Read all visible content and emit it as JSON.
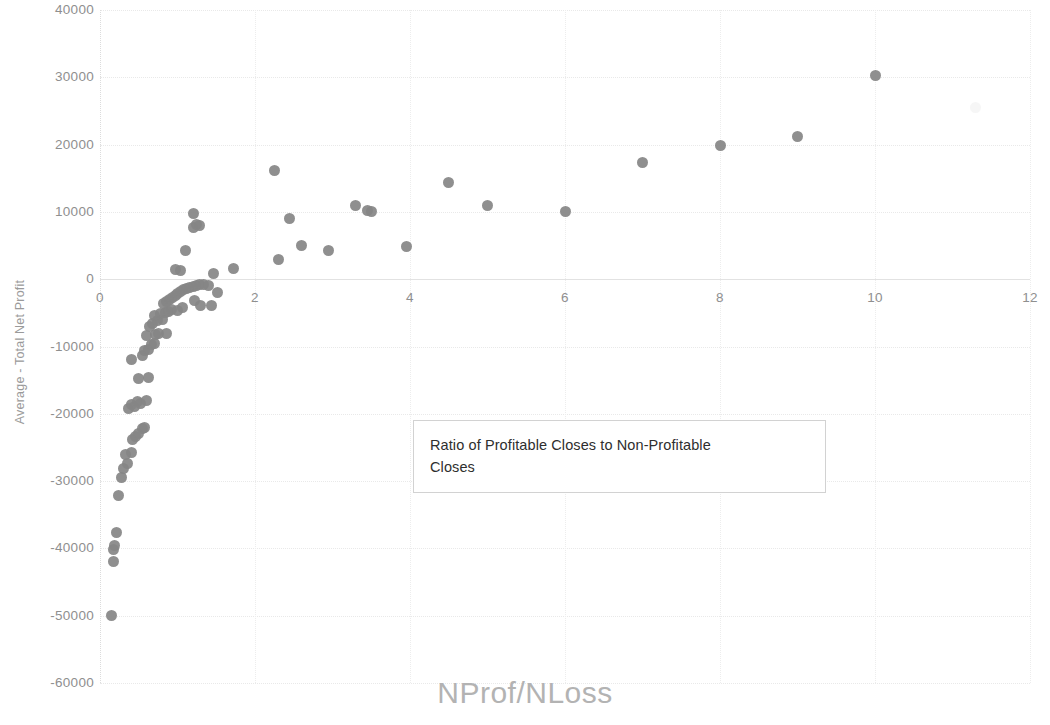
{
  "chart_data": {
    "type": "scatter",
    "title": "",
    "xlabel": "NProf/NLoss",
    "ylabel": "Average - Total Net Profit",
    "xlim": [
      0,
      12
    ],
    "ylim": [
      -60000,
      40000
    ],
    "xticks": [
      0,
      2,
      4,
      6,
      8,
      10,
      12
    ],
    "yticks": [
      40000,
      30000,
      20000,
      10000,
      0,
      -10000,
      -20000,
      -30000,
      -40000,
      -50000,
      -60000
    ],
    "xtick_labels": [
      "0",
      "2",
      "4",
      "6",
      "8",
      "10",
      "12"
    ],
    "ytick_labels": [
      "40000",
      "30000",
      "20000",
      "10000",
      "0",
      "-10000",
      "-20000",
      "-30000",
      "-40000",
      "-50000",
      "-60000"
    ],
    "grid": true,
    "legend": false,
    "marker_color": "#868686",
    "marker_shape": "circle",
    "annotation": {
      "line1": "Ratio of Profitable Closes to Non-Profitable",
      "line2": "Closes"
    },
    "series": [
      {
        "name": "Average - Total Net Profit",
        "points": [
          [
            0.15,
            -50000
          ],
          [
            0.17,
            -42000
          ],
          [
            0.18,
            -40200
          ],
          [
            0.19,
            -39600
          ],
          [
            0.21,
            -37600
          ],
          [
            0.24,
            -32200
          ],
          [
            0.28,
            -29400
          ],
          [
            0.3,
            -28200
          ],
          [
            0.35,
            -27400
          ],
          [
            0.33,
            -26000
          ],
          [
            0.4,
            -25700
          ],
          [
            0.42,
            -23800
          ],
          [
            0.46,
            -23300
          ],
          [
            0.5,
            -23000
          ],
          [
            0.55,
            -22200
          ],
          [
            0.58,
            -22000
          ],
          [
            0.37,
            -19200
          ],
          [
            0.41,
            -18600
          ],
          [
            0.45,
            -18900
          ],
          [
            0.48,
            -18200
          ],
          [
            0.52,
            -18400
          ],
          [
            0.6,
            -18000
          ],
          [
            0.5,
            -14800
          ],
          [
            0.62,
            -14600
          ],
          [
            0.4,
            -12000
          ],
          [
            0.55,
            -11300
          ],
          [
            0.58,
            -10600
          ],
          [
            0.63,
            -10400
          ],
          [
            0.66,
            -9700
          ],
          [
            0.7,
            -9500
          ],
          [
            0.6,
            -8400
          ],
          [
            0.72,
            -8200
          ],
          [
            0.76,
            -8000
          ],
          [
            0.86,
            -8100
          ],
          [
            0.64,
            -7000
          ],
          [
            0.68,
            -6600
          ],
          [
            0.74,
            -6200
          ],
          [
            0.8,
            -6000
          ],
          [
            0.7,
            -5400
          ],
          [
            0.78,
            -5100
          ],
          [
            0.84,
            -5000
          ],
          [
            0.88,
            -4800
          ],
          [
            0.92,
            -4500
          ],
          [
            1.0,
            -4600
          ],
          [
            1.06,
            -4200
          ],
          [
            0.82,
            -3600
          ],
          [
            0.86,
            -3300
          ],
          [
            0.9,
            -3000
          ],
          [
            0.94,
            -2700
          ],
          [
            0.97,
            -2400
          ],
          [
            1.0,
            -2100
          ],
          [
            1.04,
            -1900
          ],
          [
            1.08,
            -1600
          ],
          [
            1.12,
            -1400
          ],
          [
            1.16,
            -1200
          ],
          [
            1.2,
            -1050
          ],
          [
            1.24,
            -900
          ],
          [
            1.28,
            -800
          ],
          [
            1.34,
            -750
          ],
          [
            1.4,
            -1000
          ],
          [
            1.22,
            -3100
          ],
          [
            1.3,
            -3900
          ],
          [
            1.44,
            -3900
          ],
          [
            1.52,
            -2000
          ],
          [
            0.98,
            1400
          ],
          [
            1.04,
            1300
          ],
          [
            1.46,
            800
          ],
          [
            1.1,
            4300
          ],
          [
            1.2,
            7700
          ],
          [
            1.24,
            8100
          ],
          [
            1.28,
            8000
          ],
          [
            1.2,
            9700
          ],
          [
            1.72,
            1600
          ],
          [
            2.25,
            16100
          ],
          [
            2.3,
            2900
          ],
          [
            2.45,
            9000
          ],
          [
            2.6,
            5000
          ],
          [
            2.95,
            4200
          ],
          [
            3.3,
            10900
          ],
          [
            3.45,
            10200
          ],
          [
            3.5,
            10100
          ],
          [
            3.95,
            4900
          ],
          [
            4.5,
            14400
          ],
          [
            5.0,
            11000
          ],
          [
            6.0,
            10100
          ],
          [
            7.0,
            17400
          ],
          [
            8.0,
            19900
          ],
          [
            9.0,
            21200
          ],
          [
            10.0,
            30200
          ]
        ]
      }
    ],
    "artifacts": [
      [
        11.3,
        25500
      ]
    ]
  }
}
